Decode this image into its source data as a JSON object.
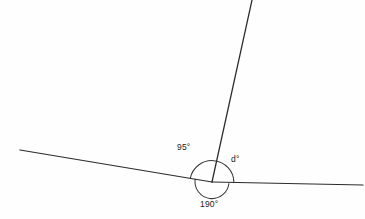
{
  "figure": {
    "kind": "angle-diagram",
    "background_color": "#fefefe",
    "line_color": "#2b2b2b",
    "arc_color": "#3a3a3a",
    "text_color": "#1a1a1a",
    "width": 365,
    "height": 219
  },
  "vertex": {
    "x": 212,
    "y": 182
  },
  "rays": [
    {
      "name": "left-ray",
      "from": {
        "x": 20,
        "y": 150
      },
      "to": {
        "x": 212,
        "y": 182
      }
    },
    {
      "name": "right-ray",
      "from": {
        "x": 212,
        "y": 182
      },
      "to": {
        "x": 363,
        "y": 185
      }
    },
    {
      "name": "upper-ray",
      "from": {
        "x": 212,
        "y": 182
      },
      "to": {
        "x": 252,
        "y": 0
      }
    }
  ],
  "arcs": [
    {
      "name": "upper-arc",
      "radius": 22,
      "description": "semicircular arc above the two near-horizontal rays"
    },
    {
      "name": "reflex-arc",
      "radius": 17,
      "description": "arc below the horizontal marking the reflex angle"
    }
  ],
  "labels": {
    "upper_left_angle": "95°",
    "upper_right_angle": "d°",
    "reflex_angle": "190°"
  }
}
